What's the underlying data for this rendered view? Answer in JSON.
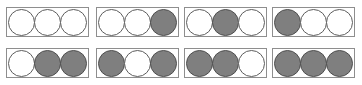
{
  "figure": {
    "name": "three-cell-binary-state-grid",
    "background_color": "#ffffff",
    "box_border_color": "#8e8e8e",
    "disc_filled_color": "#7f7f7f",
    "disc_filled_border_color": "#4f4f4f",
    "disc_empty_color": "#ffffff",
    "disc_empty_border_color": "#5d5d5d",
    "rows": 2,
    "columns": 4,
    "discs_per_box": 3,
    "total_boxes": 8,
    "states": [
      "empty",
      "filled"
    ]
  },
  "boxes": [
    {
      "id": "box-1",
      "row": 0,
      "col": 0,
      "discs": [
        "empty",
        "empty",
        "empty"
      ],
      "filled_count": 0,
      "binary": "000"
    },
    {
      "id": "box-2",
      "row": 0,
      "col": 1,
      "discs": [
        "empty",
        "empty",
        "filled"
      ],
      "filled_count": 1,
      "binary": "001"
    },
    {
      "id": "box-3",
      "row": 0,
      "col": 2,
      "discs": [
        "empty",
        "filled",
        "empty"
      ],
      "filled_count": 1,
      "binary": "010"
    },
    {
      "id": "box-4",
      "row": 0,
      "col": 3,
      "discs": [
        "filled",
        "empty",
        "empty"
      ],
      "filled_count": 1,
      "binary": "100"
    },
    {
      "id": "box-5",
      "row": 1,
      "col": 0,
      "discs": [
        "empty",
        "filled",
        "filled"
      ],
      "filled_count": 2,
      "binary": "011"
    },
    {
      "id": "box-6",
      "row": 1,
      "col": 1,
      "discs": [
        "filled",
        "empty",
        "filled"
      ],
      "filled_count": 2,
      "binary": "101"
    },
    {
      "id": "box-7",
      "row": 1,
      "col": 2,
      "discs": [
        "filled",
        "filled",
        "empty"
      ],
      "filled_count": 2,
      "binary": "110"
    },
    {
      "id": "box-8",
      "row": 1,
      "col": 3,
      "discs": [
        "filled",
        "filled",
        "filled"
      ],
      "filled_count": 3,
      "binary": "111"
    }
  ]
}
